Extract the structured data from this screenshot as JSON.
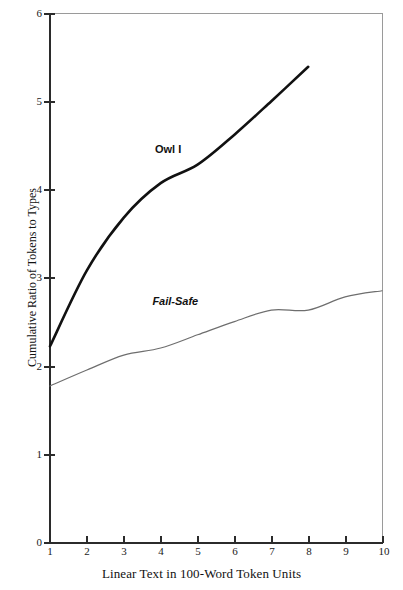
{
  "chart_data": {
    "type": "line",
    "title": "",
    "xlabel": "Linear Text in 100-Word Token Units",
    "ylabel": "Cumulative Ratio of Tokens to Types",
    "xlim": [
      1,
      10
    ],
    "ylim": [
      0,
      6
    ],
    "xticks": [
      "1",
      "2",
      "3",
      "4",
      "5",
      "6",
      "7",
      "8",
      "9",
      "10"
    ],
    "yticks": [
      "0",
      "1",
      "2",
      "3",
      "4",
      "5",
      "6"
    ],
    "grid": false,
    "legend_position": "inline-annotation",
    "series": [
      {
        "name": "Owl I",
        "color": "#111111",
        "style": "thick-solid",
        "x": [
          1,
          2,
          3,
          4,
          5,
          6,
          7,
          8
        ],
        "values": [
          2.22,
          3.08,
          3.68,
          4.07,
          4.28,
          4.62,
          5.0,
          5.39
        ],
        "label_position": {
          "x": 4.2,
          "y": 4.45
        }
      },
      {
        "name": "Fail-Safe",
        "color": "#6e6e6e",
        "style": "thin-solid",
        "x": [
          1,
          2,
          3,
          4,
          5,
          6,
          7,
          8,
          9,
          10
        ],
        "values": [
          1.77,
          1.95,
          2.12,
          2.2,
          2.35,
          2.5,
          2.63,
          2.63,
          2.78,
          2.85
        ],
        "label_position": {
          "x": 4.4,
          "y": 2.72
        }
      }
    ]
  },
  "axes": {
    "x_title": "Linear Text in 100-Word Token Units",
    "y_title": "Cumulative Ratio of Tokens to Types",
    "x_tick_labels": [
      "1",
      "2",
      "3",
      "4",
      "5",
      "6",
      "7",
      "8",
      "9",
      "10"
    ],
    "y_tick_labels": [
      "6",
      "5",
      "4",
      "3",
      "2",
      "1",
      "0"
    ]
  },
  "annotations": {
    "owl_i": "Owl I",
    "fail_safe": "Fail-Safe"
  },
  "colors": {
    "owl_i": "#111111",
    "fail_safe": "#6e6e6e",
    "axis": "#2b2b2b",
    "frame": "#9a9a9a",
    "background": "#ffffff"
  }
}
